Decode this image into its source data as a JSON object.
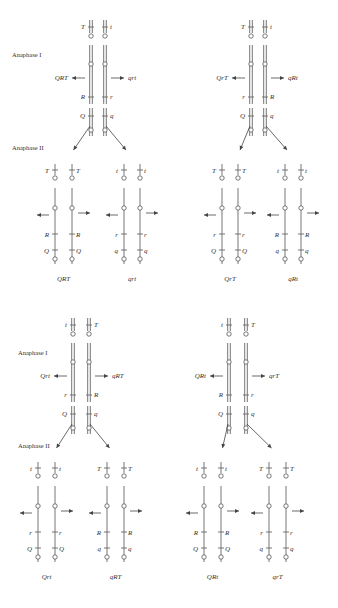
{
  "stages": {
    "anaphase1": "Anaphase I",
    "anaphase2": "Anaphase II"
  },
  "panels": [
    {
      "id": "top-left",
      "anaphase1": {
        "left": {
          "T": "T",
          "R": "R",
          "Q": "Q",
          "product": "QRT"
        },
        "right": {
          "T": "t",
          "R": "r",
          "Q": "q",
          "product": "qrt"
        }
      },
      "anaphase2": [
        {
          "left": {
            "T": "T",
            "R": "R",
            "Q": "Q"
          },
          "right": {
            "T": "T",
            "R": "R",
            "Q": "Q"
          },
          "genotype": "QRT"
        },
        {
          "left": {
            "T": "t",
            "R": "r",
            "Q": "q"
          },
          "right": {
            "T": "t",
            "R": "r",
            "Q": "q"
          },
          "genotype": "qrt"
        }
      ],
      "show_stage_labels": true
    },
    {
      "id": "top-right",
      "anaphase1": {
        "left": {
          "T": "T",
          "R": "r",
          "Q": "Q",
          "product": "QrT"
        },
        "right": {
          "T": "t",
          "R": "R",
          "Q": "q",
          "product": "qRt"
        }
      },
      "anaphase2": [
        {
          "left": {
            "T": "T",
            "R": "r",
            "Q": "Q"
          },
          "right": {
            "T": "T",
            "R": "r",
            "Q": "Q"
          },
          "genotype": "QrT"
        },
        {
          "left": {
            "T": "t",
            "R": "R",
            "Q": "q"
          },
          "right": {
            "T": "t",
            "R": "R",
            "Q": "q"
          },
          "genotype": "qRt"
        }
      ],
      "show_stage_labels": false
    },
    {
      "id": "bottom-left",
      "anaphase1": {
        "left": {
          "T": "t",
          "R": "r",
          "Q": "Q",
          "product": "Qrt"
        },
        "right": {
          "T": "T",
          "R": "R",
          "Q": "q",
          "product": "qRT"
        }
      },
      "anaphase2": [
        {
          "left": {
            "T": "t",
            "R": "r",
            "Q": "Q"
          },
          "right": {
            "T": "t",
            "R": "r",
            "Q": "Q"
          },
          "genotype": "Qrt"
        },
        {
          "left": {
            "T": "T",
            "R": "R",
            "Q": "q"
          },
          "right": {
            "T": "T",
            "R": "R",
            "Q": "q"
          },
          "genotype": "qRT"
        }
      ],
      "show_stage_labels": true
    },
    {
      "id": "bottom-right",
      "anaphase1": {
        "left": {
          "T": "t",
          "R": "R",
          "Q": "Q",
          "product": "QRt"
        },
        "right": {
          "T": "T",
          "R": "r",
          "Q": "q",
          "product": "qrT"
        }
      },
      "anaphase2": [
        {
          "left": {
            "T": "t",
            "R": "R",
            "Q": "Q"
          },
          "right": {
            "T": "t",
            "R": "R",
            "Q": "Q"
          },
          "genotype": "QRt"
        },
        {
          "left": {
            "T": "T",
            "R": "r",
            "Q": "q"
          },
          "right": {
            "T": "T",
            "R": "r",
            "Q": "q"
          },
          "genotype": "qrT"
        }
      ],
      "show_stage_labels": false
    }
  ]
}
